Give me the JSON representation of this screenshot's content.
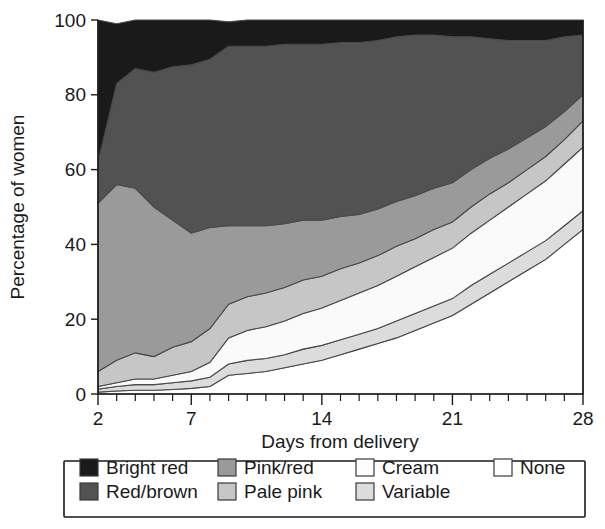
{
  "chart_data": {
    "type": "area",
    "stacked": true,
    "title": "",
    "subtitle": "",
    "xlabel": "Days from delivery",
    "ylabel": "Percentage of women",
    "xlim": [
      2,
      28
    ],
    "ylim": [
      0,
      100
    ],
    "grid": false,
    "legend_position": "bottom",
    "x_ticks_major": [
      2,
      7,
      14,
      21,
      28
    ],
    "x_tick_labels": [
      "2",
      "7",
      "14",
      "21",
      "28"
    ],
    "x_ticks_minor": [
      3,
      4,
      5,
      6,
      8,
      9,
      10,
      11,
      12,
      13,
      15,
      16,
      17,
      18,
      19,
      20,
      22,
      23,
      24,
      25,
      26,
      27
    ],
    "y_ticks": [
      0,
      20,
      40,
      60,
      80,
      100
    ],
    "y_tick_labels": [
      "0",
      "20",
      "40",
      "60",
      "80",
      "100"
    ],
    "x": [
      2,
      3,
      4,
      5,
      6,
      7,
      8,
      9,
      10,
      11,
      12,
      13,
      14,
      15,
      16,
      17,
      18,
      19,
      20,
      21,
      22,
      23,
      24,
      25,
      26,
      27,
      28
    ],
    "series": [
      {
        "name": "None",
        "color": "#ffffff",
        "values": [
          0.5,
          0.8,
          1.0,
          1.0,
          1.2,
          1.5,
          2.0,
          5.0,
          5.5,
          6.0,
          7.0,
          8.0,
          9.0,
          10.5,
          12.0,
          13.5,
          15.0,
          17.0,
          19.0,
          21.0,
          24.0,
          27.0,
          30.0,
          33.0,
          36.0,
          40.0,
          44.0
        ]
      },
      {
        "name": "Variable",
        "color": "#dcdcdc",
        "values": [
          0.8,
          1.2,
          1.5,
          1.5,
          1.8,
          2.0,
          2.5,
          3.0,
          3.5,
          3.5,
          3.5,
          4.0,
          4.0,
          4.0,
          4.0,
          4.0,
          4.5,
          4.5,
          4.5,
          4.5,
          5.0,
          5.0,
          5.0,
          5.0,
          5.0,
          5.0,
          5.0
        ]
      },
      {
        "name": "Cream",
        "color": "#fafafa",
        "values": [
          0.7,
          1.0,
          1.5,
          1.5,
          2.0,
          2.5,
          4.0,
          7.0,
          8.0,
          8.5,
          9.0,
          9.5,
          10.0,
          10.5,
          11.0,
          11.5,
          12.0,
          12.5,
          13.0,
          13.5,
          14.0,
          14.5,
          15.0,
          15.5,
          16.0,
          16.5,
          17.0
        ]
      },
      {
        "name": "Pale pink",
        "color": "#c6c6c6",
        "values": [
          4.0,
          6.0,
          7.0,
          6.0,
          7.5,
          8.0,
          9.0,
          9.0,
          9.0,
          9.0,
          9.0,
          9.0,
          8.5,
          8.5,
          8.0,
          8.0,
          8.0,
          7.5,
          7.5,
          7.0,
          7.0,
          7.0,
          6.5,
          6.5,
          6.5,
          6.5,
          7.0
        ]
      },
      {
        "name": "Pink/red",
        "color": "#9a9a9a",
        "values": [
          45.0,
          47.0,
          44.0,
          40.0,
          34.0,
          29.0,
          27.0,
          21.0,
          19.0,
          18.0,
          17.0,
          16.0,
          15.0,
          14.0,
          13.0,
          12.5,
          12.0,
          11.5,
          11.0,
          10.5,
          10.0,
          9.5,
          9.0,
          8.5,
          8.0,
          7.5,
          7.0
        ]
      },
      {
        "name": "Red/brown",
        "color": "#525252",
        "values": [
          11.0,
          27.0,
          32.0,
          36.0,
          41.0,
          45.0,
          45.0,
          48.0,
          48.0,
          48.0,
          48.0,
          47.0,
          47.0,
          46.5,
          46.0,
          45.0,
          44.0,
          43.0,
          41.0,
          39.0,
          35.5,
          32.0,
          29.0,
          26.0,
          23.0,
          20.0,
          16.0
        ]
      },
      {
        "name": "Bright red",
        "color": "#1a1a1a",
        "values": [
          38.0,
          16.0,
          13.0,
          14.0,
          12.5,
          12.0,
          10.5,
          6.5,
          7.0,
          7.0,
          6.5,
          6.5,
          6.5,
          6.0,
          6.0,
          5.5,
          4.5,
          4.0,
          4.0,
          4.5,
          4.5,
          5.0,
          5.5,
          5.5,
          5.5,
          4.5,
          4.0
        ]
      }
    ]
  },
  "legend": {
    "items": [
      {
        "label": "Bright red",
        "color": "#1a1a1a"
      },
      {
        "label": "Red/brown",
        "color": "#525252"
      },
      {
        "label": "Pink/red",
        "color": "#9a9a9a"
      },
      {
        "label": "Pale pink",
        "color": "#c6c6c6"
      },
      {
        "label": "Cream",
        "color": "#fdfdfd"
      },
      {
        "label": "Variable",
        "color": "#dcdcdc"
      },
      {
        "label": "None",
        "color": "#ffffff"
      }
    ]
  }
}
